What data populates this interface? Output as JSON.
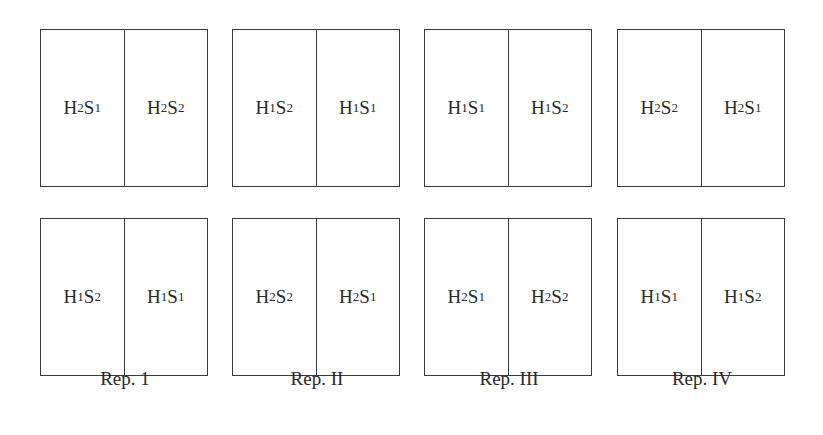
{
  "diagram": {
    "type": "split-plot field layout",
    "replications": [
      {
        "label": "Rep. 1",
        "plots": [
          {
            "left": {
              "H": "2",
              "S": "1"
            },
            "right": {
              "H": "2",
              "S": "2"
            }
          },
          {
            "left": {
              "H": "1",
              "S": "2"
            },
            "right": {
              "H": "1",
              "S": "1"
            }
          }
        ]
      },
      {
        "label": "Rep. II",
        "plots": [
          {
            "left": {
              "H": "1",
              "S": "2"
            },
            "right": {
              "H": "1",
              "S": "1"
            }
          },
          {
            "left": {
              "H": "2",
              "S": "2"
            },
            "right": {
              "H": "2",
              "S": "1"
            }
          }
        ]
      },
      {
        "label": "Rep. III",
        "plots": [
          {
            "left": {
              "H": "1",
              "S": "1"
            },
            "right": {
              "H": "1",
              "S": "2"
            }
          },
          {
            "left": {
              "H": "2",
              "S": "1"
            },
            "right": {
              "H": "2",
              "S": "2"
            }
          }
        ]
      },
      {
        "label": "Rep. IV",
        "plots": [
          {
            "left": {
              "H": "2",
              "S": "2"
            },
            "right": {
              "H": "2",
              "S": "1"
            }
          },
          {
            "left": {
              "H": "1",
              "S": "1"
            },
            "right": {
              "H": "1",
              "S": "2"
            }
          }
        ]
      }
    ],
    "colors": {
      "line": "#3a3a3a",
      "text": "#2a2a2a",
      "background": "#ffffff"
    }
  }
}
